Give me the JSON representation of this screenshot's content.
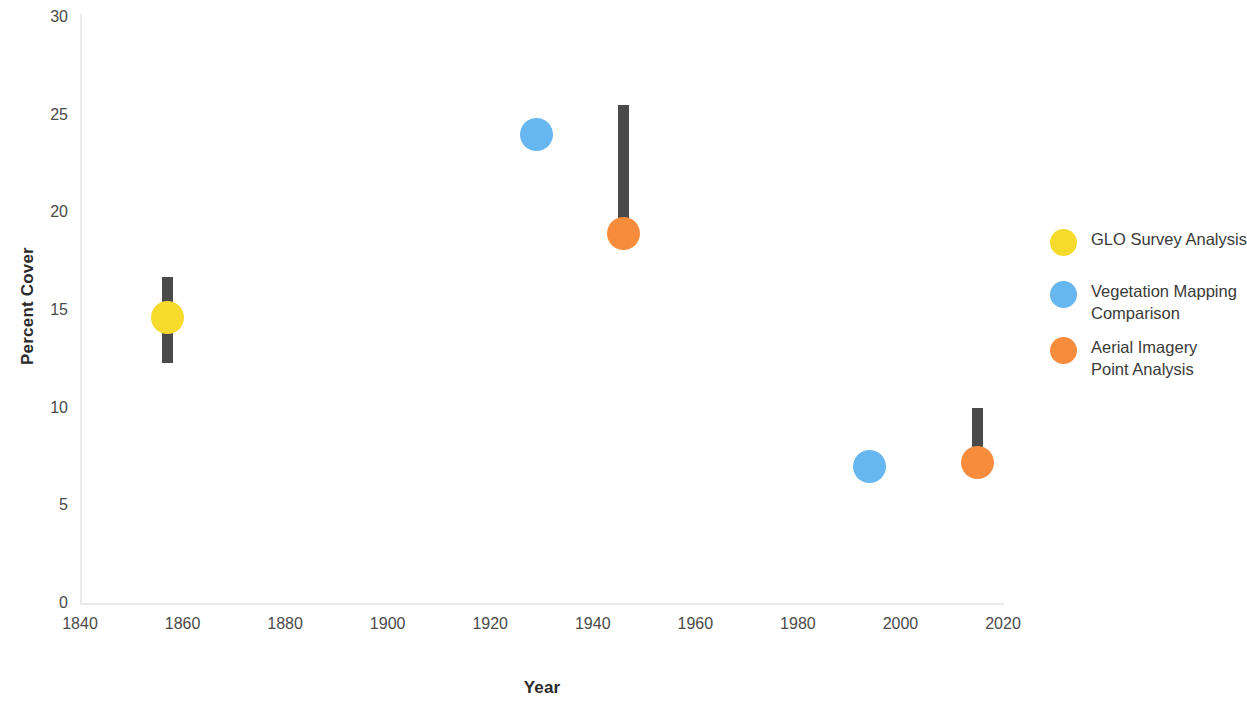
{
  "chart_data": {
    "type": "scatter",
    "title": "",
    "xlabel": "Year",
    "ylabel": "Percent Cover",
    "xlim": [
      1840,
      2020
    ],
    "ylim": [
      0,
      30
    ],
    "xticks": [
      1840,
      1860,
      1880,
      1900,
      1920,
      1940,
      1960,
      1980,
      2000,
      2020
    ],
    "yticks": [
      0,
      5,
      10,
      15,
      20,
      25,
      30
    ],
    "grid": false,
    "legend_position": "right",
    "errorbar_color": "#4a4a4a",
    "axis_color": "#e9e9e9",
    "series": [
      {
        "name": "GLO Survey Analysis",
        "color": "#F7DB2C",
        "points": [
          {
            "x": 1857,
            "y": 14.6,
            "y_low": 12.3,
            "y_high": 16.7,
            "has_errorbar": true
          }
        ]
      },
      {
        "name": "Vegetation Mapping Comparison",
        "color": "#66B6F0",
        "points": [
          {
            "x": 1929,
            "y": 24.0,
            "y_low": 24.0,
            "y_high": 24.0,
            "has_errorbar": false
          },
          {
            "x": 1994,
            "y": 7.0,
            "y_low": 7.0,
            "y_high": 7.0,
            "has_errorbar": false
          }
        ]
      },
      {
        "name": "Aerial Imagery Point Analysis",
        "color": "#F68C3C",
        "points": [
          {
            "x": 1946,
            "y": 18.9,
            "y_low": 18.9,
            "y_high": 25.5,
            "has_errorbar": true
          },
          {
            "x": 2015,
            "y": 7.2,
            "y_low": 7.2,
            "y_high": 10.0,
            "has_errorbar": true
          }
        ]
      }
    ]
  },
  "legend": {
    "entries": [
      {
        "label": "GLO Survey Analysis",
        "color": "#F7DB2C"
      },
      {
        "label": "Vegetation Mapping\nComparison",
        "color": "#66B6F0"
      },
      {
        "label": "Aerial Imagery\nPoint Analysis",
        "color": "#F68C3C"
      }
    ]
  },
  "axes": {
    "x_title": "Year",
    "y_title": "Percent Cover",
    "x_tick_labels": [
      "1840",
      "1860",
      "1880",
      "1900",
      "1920",
      "1940",
      "1960",
      "1980",
      "2000",
      "2020"
    ],
    "y_tick_labels": [
      "0",
      "5",
      "10",
      "15",
      "20",
      "25",
      "30"
    ]
  }
}
